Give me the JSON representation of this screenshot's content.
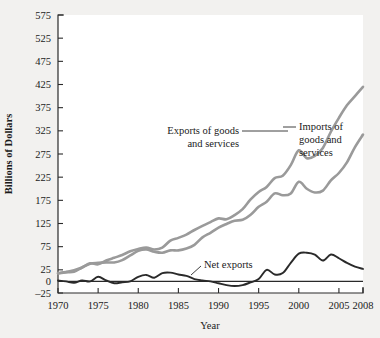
{
  "chart_data": {
    "type": "line",
    "title": "",
    "subtitle": "",
    "xlabel": "Year",
    "ylabel": "Billions of Dollars",
    "xlim": [
      1970,
      2008
    ],
    "ylim": [
      -25,
      575
    ],
    "grid": false,
    "legend_position": "inline-annotations",
    "xticks": [
      1970,
      1975,
      1980,
      1985,
      1990,
      1995,
      2000,
      2005,
      2008
    ],
    "xtick_labels": [
      "1970",
      "1975",
      "1980",
      "1985",
      "1990",
      "1995",
      "2000",
      "2005",
      "2008"
    ],
    "yticks": [
      -25,
      0,
      25,
      75,
      125,
      175,
      225,
      275,
      325,
      375,
      425,
      475,
      525,
      575
    ],
    "ytick_labels": [
      "–25",
      "0",
      "25",
      "75",
      "125",
      "175",
      "225",
      "275",
      "325",
      "375",
      "425",
      "475",
      "525",
      "575"
    ],
    "x": [
      1970,
      1971,
      1972,
      1973,
      1974,
      1975,
      1976,
      1977,
      1978,
      1979,
      1980,
      1981,
      1982,
      1983,
      1984,
      1985,
      1986,
      1987,
      1988,
      1989,
      1990,
      1991,
      1992,
      1993,
      1994,
      1995,
      1996,
      1997,
      1998,
      1999,
      2000,
      2001,
      2002,
      2003,
      2004,
      2005,
      2006,
      2007,
      2008
    ],
    "series": [
      {
        "name": "Exports of goods and services",
        "color": "#9a9a9a",
        "values": [
          18,
          20,
          21,
          30,
          38,
          40,
          41,
          41,
          46,
          56,
          66,
          69,
          64,
          62,
          67,
          67,
          71,
          79,
          95,
          105,
          116,
          124,
          131,
          133,
          144,
          161,
          172,
          190,
          186,
          190,
          215,
          200,
          192,
          196,
          218,
          234,
          257,
          290,
          317
        ]
      },
      {
        "name": "Imports of goods and services",
        "color": "#9a9a9a",
        "values": [
          17,
          20,
          24,
          30,
          39,
          37,
          45,
          51,
          57,
          65,
          70,
          73,
          69,
          73,
          88,
          94,
          101,
          111,
          120,
          128,
          136,
          134,
          143,
          156,
          177,
          193,
          204,
          223,
          228,
          251,
          283,
          266,
          271,
          288,
          323,
          353,
          380,
          400,
          420
        ]
      }
    ],
    "annotations": [
      {
        "label": "Exports of goods and services",
        "lines": [
          "Exports of goods",
          "and services"
        ],
        "align": "right"
      },
      {
        "label": "Imports of goods and services",
        "lines": [
          "Imports of",
          "goods and",
          "services"
        ],
        "align": "left"
      },
      {
        "label": "Net exports",
        "lines": [
          "Net exports"
        ],
        "align": "left"
      }
    ],
    "net_exports": {
      "name": "Net exports",
      "color": "#2a2a2a",
      "values": [
        2,
        0,
        -3,
        2,
        0,
        10,
        2,
        -4,
        -2,
        0,
        10,
        14,
        8,
        18,
        19,
        15,
        12,
        5,
        2,
        0,
        -4,
        -8,
        -10,
        -8,
        -2,
        5,
        25,
        15,
        18,
        40,
        60,
        62,
        58,
        45,
        58,
        50,
        40,
        32,
        27
      ]
    }
  },
  "axis": {
    "y_title": "Billions of Dollars",
    "x_title": "Year"
  },
  "labels": {
    "exports_line1": "Exports of goods",
    "exports_line2": "and services",
    "imports_line1": "Imports of",
    "imports_line2": "goods and",
    "imports_line3": "services",
    "net_exports": "Net exports"
  },
  "y_ticks": [
    {
      "value": 575,
      "text": "575"
    },
    {
      "value": 525,
      "text": "525"
    },
    {
      "value": 475,
      "text": "475"
    },
    {
      "value": 425,
      "text": "425"
    },
    {
      "value": 375,
      "text": "375"
    },
    {
      "value": 325,
      "text": "325"
    },
    {
      "value": 275,
      "text": "275"
    },
    {
      "value": 225,
      "text": "225"
    },
    {
      "value": 175,
      "text": "175"
    },
    {
      "value": 125,
      "text": "125"
    },
    {
      "value": 75,
      "text": "75"
    },
    {
      "value": 25,
      "text": "25"
    },
    {
      "value": 0,
      "text": "0"
    },
    {
      "value": -25,
      "text": "–25"
    }
  ],
  "x_ticks": [
    {
      "value": 1970,
      "text": "1970"
    },
    {
      "value": 1975,
      "text": "1975"
    },
    {
      "value": 1980,
      "text": "1980"
    },
    {
      "value": 1985,
      "text": "1985"
    },
    {
      "value": 1990,
      "text": "1990"
    },
    {
      "value": 1995,
      "text": "1995"
    },
    {
      "value": 2000,
      "text": "2000"
    },
    {
      "value": 2005,
      "text": "2005"
    },
    {
      "value": 2008,
      "text": "2008"
    }
  ],
  "colors": {
    "page_background": "#f2f1ef",
    "plot_background": "#ffffff",
    "axis": "#2a2a2a",
    "gray_series": "#9a9a9a",
    "dark_series": "#2a2a2a"
  }
}
